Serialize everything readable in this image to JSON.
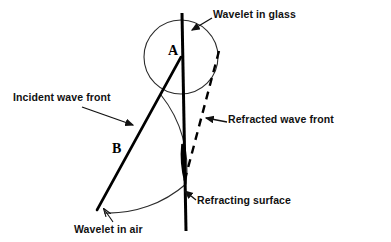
{
  "diagram": {
    "canvas": {
      "width": 391,
      "height": 242,
      "background": "#ffffff"
    },
    "colors": {
      "stroke": "#000000",
      "text": "#111111",
      "arc": "#2b2b2b",
      "background": "#ffffff"
    },
    "labels": {
      "wavelet_in_glass": "Wavelet in glass",
      "incident_wave_front": "Incident wave front",
      "refracted_wave_front": "Refracted wave front",
      "refracting_surface": "Refracting surface",
      "wavelet_in_air": "Wavelet in air",
      "point_a": "A",
      "point_b": "B"
    },
    "geometry": {
      "refracting_surface": {
        "x1": 182,
        "y1": 13,
        "x2": 186,
        "y2": 231
      },
      "incident_wave_front": {
        "x1": 181,
        "y1": 57,
        "x2": 98,
        "y2": 209
      },
      "refracted_wave_front": {
        "x1": 219,
        "y1": 51,
        "x2": 184,
        "y2": 182,
        "style": "dashed"
      },
      "wavelet_glass_arc": {
        "cx": 181,
        "cy": 57,
        "r": 37
      },
      "wavelet_air_arc": {
        "cx": 99,
        "cy": 208,
        "r": 118
      }
    },
    "pointers": [
      {
        "name": "wavelet-in-glass-pointer",
        "from": [
          212,
          18
        ],
        "to": [
          190,
          31
        ]
      },
      {
        "name": "incident-wave-front-pointer",
        "from": [
          82,
          108
        ],
        "to": [
          135,
          126
        ]
      },
      {
        "name": "refracted-wave-front-pointer",
        "from": [
          226,
          124
        ],
        "to": [
          205,
          119
        ]
      },
      {
        "name": "refracting-surface-pointer",
        "from": [
          196,
          199
        ],
        "to": [
          184,
          190
        ]
      },
      {
        "name": "wavelet-in-air-pointer",
        "from": [
          112,
          222
        ],
        "to": [
          104,
          208
        ]
      }
    ]
  }
}
